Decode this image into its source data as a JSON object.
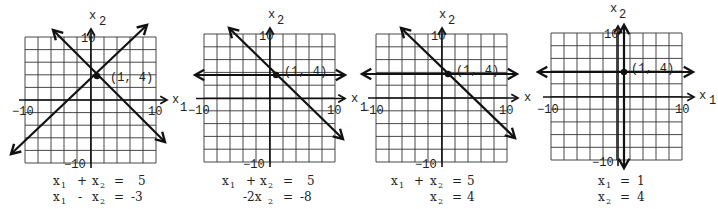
{
  "figure": {
    "point_label": "(1,  4)",
    "axis_labels": {
      "x": "x",
      "x_sub": "1",
      "y": "x",
      "y_sub": "2"
    },
    "tick_labels": {
      "x_min": "−10",
      "x_max": "10",
      "y_max": "10",
      "y_min": "−10"
    },
    "panels": [
      {
        "id": "panel-1",
        "equations": [
          {
            "lhs": [
              "x",
              "1",
              " + ",
              "x",
              "2"
            ],
            "text": "x₁ + x₂ =  5",
            "rhs": "5"
          },
          {
            "lhs": [
              "x",
              "1",
              " − ",
              "x",
              "2"
            ],
            "text": "x₁ − x₂ = −3",
            "rhs": "−3"
          }
        ]
      },
      {
        "id": "panel-2",
        "equations": [
          {
            "text": "x₁ + x₂ =  5",
            "rhs": "5"
          },
          {
            "text": "−2x₂ = −8",
            "rhs": "−8"
          }
        ]
      },
      {
        "id": "panel-3",
        "equations": [
          {
            "text": "x₁ + x₂ = 5",
            "rhs": "5"
          },
          {
            "text": "x₂ = 4",
            "rhs": "4"
          }
        ]
      },
      {
        "id": "panel-4",
        "equations": [
          {
            "text": "x₁ = 1",
            "rhs": "1"
          },
          {
            "text": "x₂ = 4",
            "rhs": "4"
          }
        ]
      }
    ]
  },
  "labels": {
    "p1": {
      "eq1_a": "x",
      "eq1_a_sub": "1",
      "eq1_op": "+",
      "eq1_b": "x",
      "eq1_b_sub": "2",
      "eq1_eq": "=",
      "eq1_rhs": "5",
      "eq2_a": "x",
      "eq2_a_sub": "1",
      "eq2_op": "-",
      "eq2_b": "x",
      "eq2_b_sub": "2",
      "eq2_eq": "=",
      "eq2_rhs": "-3"
    },
    "p2": {
      "eq1_a": "x",
      "eq1_a_sub": "1",
      "eq1_op": "+",
      "eq1_b": "x",
      "eq1_b_sub": "2",
      "eq1_eq": "=",
      "eq1_rhs": "5",
      "eq2_coef": "-2x",
      "eq2_sub": "2",
      "eq2_eq": "=",
      "eq2_rhs": "-8"
    },
    "p3": {
      "eq1_a": "x",
      "eq1_a_sub": "1",
      "eq1_op": "+",
      "eq1_b": "x",
      "eq1_b_sub": "2",
      "eq1_eq": "=",
      "eq1_rhs": "5",
      "eq2_b": "x",
      "eq2_b_sub": "2",
      "eq2_eq": "=",
      "eq2_rhs": "4"
    },
    "p4": {
      "eq1_a": "x",
      "eq1_a_sub": "1",
      "eq1_eq": "=",
      "eq1_rhs": "1",
      "eq2_b": "x",
      "eq2_b_sub": "2",
      "eq2_eq": "=",
      "eq2_rhs": "4"
    }
  },
  "colors": {
    "ink": "#111111",
    "grid": "#333333",
    "background": "#ffffff"
  }
}
